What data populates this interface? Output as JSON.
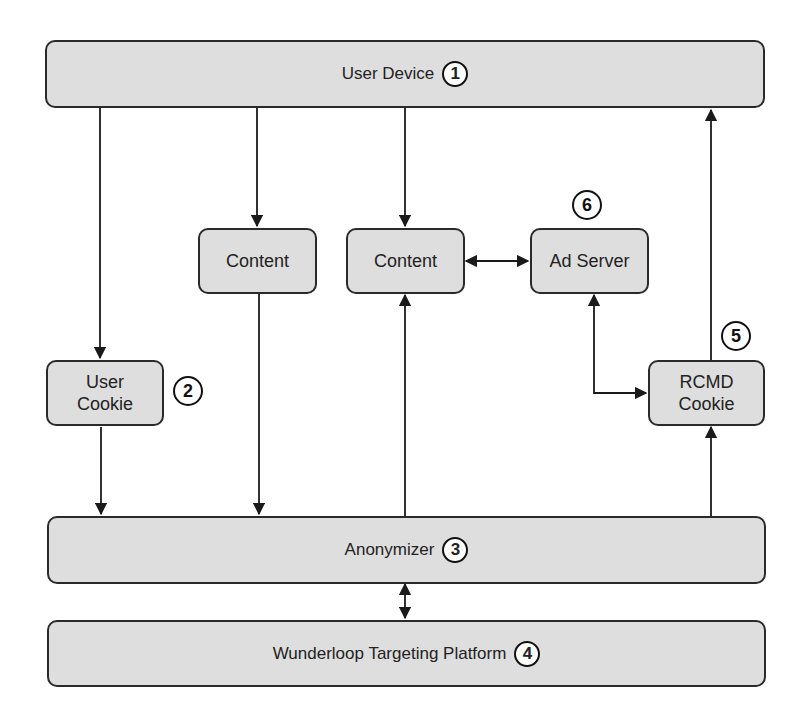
{
  "diagram": {
    "nodes": {
      "user_device": {
        "label": "User Device",
        "step": "1"
      },
      "content_left": {
        "label": "Content"
      },
      "content_center": {
        "label": "Content"
      },
      "ad_server": {
        "label": "Ad Server"
      },
      "user_cookie": {
        "label_line1": "User",
        "label_line2": "Cookie"
      },
      "rcmd_cookie": {
        "label_line1": "RCMD",
        "label_line2": "Cookie"
      },
      "anonymizer": {
        "label": "Anonymizer",
        "step": "3"
      },
      "wunderloop": {
        "label": "Wunderloop Targeting Platform",
        "step": "4"
      }
    },
    "step_badges": {
      "user_cookie_step": "2",
      "rcmd_cookie_step": "5",
      "ad_server_step": "6"
    },
    "edges": [
      {
        "from": "User Device",
        "to": "User Cookie",
        "type": "arrow"
      },
      {
        "from": "User Device",
        "to": "Content (left)",
        "type": "arrow"
      },
      {
        "from": "User Device",
        "to": "Content (center)",
        "type": "arrow"
      },
      {
        "from": "Content (left)",
        "to": "Anonymizer",
        "type": "arrow"
      },
      {
        "from": "User Cookie",
        "to": "Anonymizer",
        "type": "arrow"
      },
      {
        "from": "Anonymizer",
        "to": "Content (center)",
        "type": "arrow"
      },
      {
        "from": "Content (center)",
        "to": "Ad Server",
        "type": "bidirectional"
      },
      {
        "from": "Ad Server",
        "to": "RCMD Cookie",
        "type": "bidirectional"
      },
      {
        "from": "Anonymizer",
        "to": "RCMD Cookie",
        "type": "arrow"
      },
      {
        "from": "RCMD Cookie",
        "to": "User Device",
        "type": "arrow"
      },
      {
        "from": "Anonymizer",
        "to": "Wunderloop Targeting Platform",
        "type": "bidirectional"
      }
    ],
    "colors": {
      "box_fill": "#dedede",
      "stroke": "#2a2a2a",
      "background": "#ffffff"
    }
  }
}
